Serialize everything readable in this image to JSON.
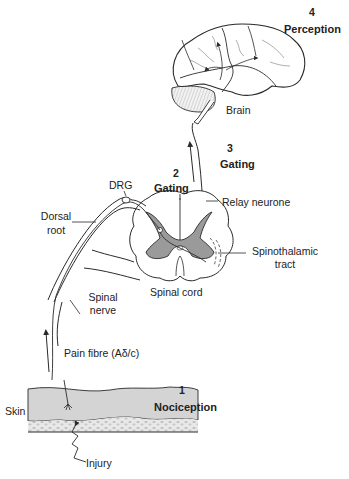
{
  "stages": [
    {
      "number": "1",
      "name": "Nociception"
    },
    {
      "number": "2",
      "name": "Gating"
    },
    {
      "number": "3",
      "name": "Transmission"
    },
    {
      "number": "4",
      "name": "Perception"
    }
  ],
  "labels": {
    "brain": "Brain",
    "drg": "DRG",
    "dorsal_root_line1": "Dorsal",
    "dorsal_root_line2": "root",
    "relay_neurone": "Relay neurone",
    "spinothalamic_line1": "Spinothalamic",
    "spinothalamic_line2": "tract",
    "spinal_cord": "Spinal cord",
    "spinal_nerve_line1": "Spinal",
    "spinal_nerve_line2": "nerve",
    "pain_fibre": "Pain fibre (Aδ/c)",
    "skin": "Skin",
    "injury": "Injury"
  },
  "colors": {
    "line": "#2a2a2a",
    "grey_matter": "#9a9a9a",
    "skin_fill": "#d4d4d4",
    "subcut_fill": "#e6e6e6"
  }
}
